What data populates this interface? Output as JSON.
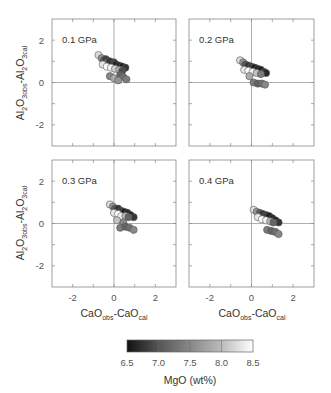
{
  "chart_data": [
    {
      "type": "scatter",
      "panel_label": "0.1 GPa",
      "xlabel": "",
      "ylabel": "Al2O3obs-Al2O3cal",
      "xlim": [
        -3,
        3
      ],
      "ylim": [
        -3,
        3
      ],
      "xticks": [
        -2,
        0,
        2
      ],
      "yticks": [
        -2,
        0,
        2
      ],
      "points": [
        {
          "x": -0.75,
          "y": 1.3,
          "mgo": 8.2
        },
        {
          "x": -0.6,
          "y": 1.15,
          "mgo": 7.6
        },
        {
          "x": -0.5,
          "y": 1.05,
          "mgo": 7.2
        },
        {
          "x": -0.4,
          "y": 1.1,
          "mgo": 6.9
        },
        {
          "x": -0.3,
          "y": 0.95,
          "mgo": 7.4
        },
        {
          "x": -0.2,
          "y": 1.0,
          "mgo": 6.8
        },
        {
          "x": -0.1,
          "y": 0.9,
          "mgo": 6.7
        },
        {
          "x": 0.0,
          "y": 0.95,
          "mgo": 6.9
        },
        {
          "x": 0.1,
          "y": 0.85,
          "mgo": 6.6
        },
        {
          "x": 0.25,
          "y": 0.8,
          "mgo": 6.7
        },
        {
          "x": 0.4,
          "y": 0.75,
          "mgo": 6.6
        },
        {
          "x": 0.55,
          "y": 0.7,
          "mgo": 6.8
        },
        {
          "x": -0.55,
          "y": 0.85,
          "mgo": 8.3
        },
        {
          "x": -0.35,
          "y": 0.75,
          "mgo": 8.5
        },
        {
          "x": -0.15,
          "y": 0.7,
          "mgo": 8.4
        },
        {
          "x": 0.05,
          "y": 0.65,
          "mgo": 8.1
        },
        {
          "x": 0.25,
          "y": 0.6,
          "mgo": 7.8
        },
        {
          "x": 0.4,
          "y": 0.55,
          "mgo": 7.0
        },
        {
          "x": -0.2,
          "y": 0.3,
          "mgo": 7.5
        },
        {
          "x": 0.0,
          "y": 0.2,
          "mgo": 7.8
        },
        {
          "x": 0.3,
          "y": 0.35,
          "mgo": 7.2
        },
        {
          "x": 0.45,
          "y": 0.25,
          "mgo": 7.3
        },
        {
          "x": 0.6,
          "y": 0.15,
          "mgo": 7.4
        },
        {
          "x": 0.2,
          "y": 0.1,
          "mgo": 7.6
        }
      ]
    },
    {
      "type": "scatter",
      "panel_label": "0.2 GPa",
      "xlabel": "",
      "ylabel": "",
      "xlim": [
        -3,
        3
      ],
      "ylim": [
        -3,
        3
      ],
      "xticks": [
        -2,
        0,
        2
      ],
      "yticks": [
        -2,
        0,
        2
      ],
      "points": [
        {
          "x": -0.55,
          "y": 1.05,
          "mgo": 8.2
        },
        {
          "x": -0.4,
          "y": 0.95,
          "mgo": 7.6
        },
        {
          "x": -0.3,
          "y": 0.85,
          "mgo": 7.1
        },
        {
          "x": -0.15,
          "y": 0.8,
          "mgo": 6.8
        },
        {
          "x": 0.0,
          "y": 0.75,
          "mgo": 6.9
        },
        {
          "x": 0.15,
          "y": 0.7,
          "mgo": 6.6
        },
        {
          "x": 0.3,
          "y": 0.65,
          "mgo": 6.7
        },
        {
          "x": 0.45,
          "y": 0.6,
          "mgo": 6.6
        },
        {
          "x": 0.6,
          "y": 0.5,
          "mgo": 6.8
        },
        {
          "x": 0.7,
          "y": 0.45,
          "mgo": 6.7
        },
        {
          "x": -0.35,
          "y": 0.6,
          "mgo": 8.3
        },
        {
          "x": -0.15,
          "y": 0.55,
          "mgo": 8.5
        },
        {
          "x": 0.05,
          "y": 0.5,
          "mgo": 8.4
        },
        {
          "x": 0.25,
          "y": 0.45,
          "mgo": 8.0
        },
        {
          "x": 0.45,
          "y": 0.4,
          "mgo": 7.4
        },
        {
          "x": -0.1,
          "y": 0.3,
          "mgo": 7.8
        },
        {
          "x": 0.1,
          "y": 0.0,
          "mgo": 7.4
        },
        {
          "x": 0.3,
          "y": -0.05,
          "mgo": 7.2
        },
        {
          "x": 0.5,
          "y": -0.05,
          "mgo": 7.3
        },
        {
          "x": 0.65,
          "y": -0.1,
          "mgo": 7.5
        }
      ]
    },
    {
      "type": "scatter",
      "panel_label": "0.3 GPa",
      "xlabel": "CaOobs-CaOcal",
      "ylabel": "Al2O3obs-Al2O3cal",
      "xlim": [
        -3,
        3
      ],
      "ylim": [
        -3,
        3
      ],
      "xticks": [
        -2,
        0,
        2
      ],
      "yticks": [
        -2,
        0,
        2
      ],
      "points": [
        {
          "x": -0.2,
          "y": 0.9,
          "mgo": 8.2
        },
        {
          "x": -0.05,
          "y": 0.8,
          "mgo": 7.6
        },
        {
          "x": 0.05,
          "y": 0.7,
          "mgo": 7.1
        },
        {
          "x": 0.2,
          "y": 0.7,
          "mgo": 6.8
        },
        {
          "x": 0.35,
          "y": 0.6,
          "mgo": 6.9
        },
        {
          "x": 0.5,
          "y": 0.55,
          "mgo": 6.6
        },
        {
          "x": 0.65,
          "y": 0.5,
          "mgo": 6.7
        },
        {
          "x": 0.8,
          "y": 0.4,
          "mgo": 6.6
        },
        {
          "x": 0.95,
          "y": 0.3,
          "mgo": 6.8
        },
        {
          "x": 0.0,
          "y": 0.5,
          "mgo": 8.3
        },
        {
          "x": 0.2,
          "y": 0.45,
          "mgo": 8.5
        },
        {
          "x": 0.35,
          "y": 0.35,
          "mgo": 8.4
        },
        {
          "x": 0.55,
          "y": 0.35,
          "mgo": 7.9
        },
        {
          "x": 0.7,
          "y": 0.3,
          "mgo": 7.2
        },
        {
          "x": 0.15,
          "y": 0.15,
          "mgo": 8.0
        },
        {
          "x": 0.45,
          "y": 0.05,
          "mgo": 7.5
        },
        {
          "x": 0.3,
          "y": -0.2,
          "mgo": 7.4
        },
        {
          "x": 0.55,
          "y": -0.15,
          "mgo": 7.2
        },
        {
          "x": 0.75,
          "y": -0.2,
          "mgo": 7.3
        },
        {
          "x": 0.95,
          "y": -0.3,
          "mgo": 7.5
        }
      ]
    },
    {
      "type": "scatter",
      "panel_label": "0.4 GPa",
      "xlabel": "CaOobs-CaOcal",
      "ylabel": "",
      "xlim": [
        -3,
        3
      ],
      "ylim": [
        -3,
        3
      ],
      "xticks": [
        -2,
        0,
        2
      ],
      "yticks": [
        -2,
        0,
        2
      ],
      "points": [
        {
          "x": 0.1,
          "y": 0.65,
          "mgo": 8.2
        },
        {
          "x": 0.25,
          "y": 0.55,
          "mgo": 7.6
        },
        {
          "x": 0.4,
          "y": 0.5,
          "mgo": 7.1
        },
        {
          "x": 0.55,
          "y": 0.45,
          "mgo": 6.8
        },
        {
          "x": 0.7,
          "y": 0.4,
          "mgo": 6.9
        },
        {
          "x": 0.85,
          "y": 0.35,
          "mgo": 6.6
        },
        {
          "x": 1.0,
          "y": 0.25,
          "mgo": 6.7
        },
        {
          "x": 1.15,
          "y": 0.15,
          "mgo": 6.6
        },
        {
          "x": 1.3,
          "y": 0.05,
          "mgo": 6.8
        },
        {
          "x": 0.3,
          "y": 0.3,
          "mgo": 8.3
        },
        {
          "x": 0.5,
          "y": 0.2,
          "mgo": 8.5
        },
        {
          "x": 0.7,
          "y": 0.15,
          "mgo": 8.4
        },
        {
          "x": 0.9,
          "y": 0.1,
          "mgo": 7.9
        },
        {
          "x": 1.05,
          "y": 0.05,
          "mgo": 7.2
        },
        {
          "x": 0.75,
          "y": -0.3,
          "mgo": 7.4
        },
        {
          "x": 0.95,
          "y": -0.35,
          "mgo": 7.2
        },
        {
          "x": 1.15,
          "y": -0.4,
          "mgo": 7.3
        },
        {
          "x": 1.3,
          "y": -0.5,
          "mgo": 7.5
        }
      ]
    }
  ],
  "colorbar": {
    "label": "MgO (wt%)",
    "ticks": [
      "6.5",
      "7.0",
      "7.5",
      "8.0",
      "8.5"
    ],
    "range": [
      6.5,
      8.5
    ],
    "color_low": "#111111",
    "color_high": "#ffffff"
  },
  "axes_labels": {
    "y_main": "Al",
    "y_sub1": "2",
    "y_mid": "O",
    "y_sub2": "3obs",
    "y_dash": "-Al",
    "y_sub3": "2",
    "y_mid2": "O",
    "y_sub4": "3cal",
    "x_main": "CaO",
    "x_sub1": "obs",
    "x_dash": "-CaO",
    "x_sub2": "cal"
  }
}
